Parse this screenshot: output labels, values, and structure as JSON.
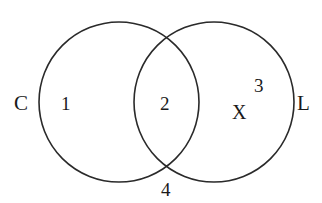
{
  "diagram": {
    "type": "venn",
    "stroke_color": "#2a2a2a",
    "sets": [
      {
        "name": "C",
        "label": "C",
        "cx": 119,
        "cy": 102,
        "r": 80
      },
      {
        "name": "L",
        "label": "L",
        "cx": 214,
        "cy": 102,
        "r": 80
      }
    ],
    "regions": {
      "only_c": "1",
      "intersection": "2",
      "only_l": "3",
      "outside": "4"
    },
    "marker": "X"
  }
}
